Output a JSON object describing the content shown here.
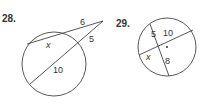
{
  "problems": [
    {
      "number": "28.",
      "labels": {
        "outer_top": "6",
        "outer_bottom": "5",
        "inner_top": "x",
        "inner_bottom": "10"
      }
    },
    {
      "number": "29.",
      "labels": {
        "seg_a": "5",
        "seg_b": "10",
        "seg_c": "x",
        "seg_d": "8"
      }
    }
  ]
}
